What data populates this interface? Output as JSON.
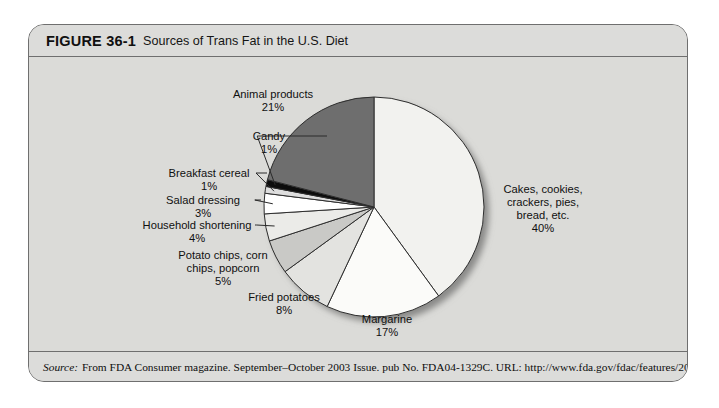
{
  "figure": {
    "number": "FIGURE 36-1",
    "caption": "Sources of Trans Fat in the U.S. Diet"
  },
  "source": {
    "label": "Source:",
    "text": "From FDA Consumer magazine. September–October 2003 Issue. pub No. FDA04-1329C. URL: http://www.fda.gov/fdac/features/2003?504_fats.html"
  },
  "colors": {
    "card_background": "#dcdcda",
    "plot_background": "#dbdbd8",
    "border": "#6f6f6f",
    "slice_stroke": "#2e2e2e",
    "text": "#101010"
  },
  "chart_data": {
    "type": "pie",
    "title": "Sources of Trans Fat in the U.S. Diet",
    "units": "percent",
    "legend": "none",
    "labels_position": "outside-with-leader-lines",
    "start_angle_deg": 0,
    "direction": "clockwise",
    "categories": [
      "Cakes, cookies, crackers, pies, bread, etc.",
      "Margarine",
      "Fried potatoes",
      "Potato chips, corn chips, popcorn",
      "Household shortening",
      "Salad dressing",
      "Breakfast cereal",
      "Candy",
      "Animal products"
    ],
    "values": [
      40,
      17,
      8,
      5,
      4,
      3,
      1,
      1,
      21
    ],
    "slices": [
      {
        "name": "Cakes, cookies, crackers, pies, bread, etc.",
        "label_lines": [
          "Cakes, cookies,",
          "crackers, pies,",
          "bread, etc."
        ],
        "value": 40,
        "value_text": "40%",
        "color": "#f2f2ef",
        "label_x": 542,
        "label_y": 192,
        "anchor": "middle",
        "leader": false
      },
      {
        "name": "Margarine",
        "label_lines": [
          "Margarine"
        ],
        "value": 17,
        "value_text": "17%",
        "color": "#fbfbf9",
        "label_x": 386,
        "label_y": 322,
        "anchor": "middle",
        "leader": false
      },
      {
        "name": "Fried potatoes",
        "label_lines": [
          "Fried potatoes"
        ],
        "value": 8,
        "value_text": "8%",
        "color": "#e3e3e0",
        "label_x": 283,
        "label_y": 300,
        "anchor": "middle",
        "leader": false
      },
      {
        "name": "Potato chips, corn chips, popcorn",
        "label_lines": [
          "Potato chips, corn",
          "chips, popcorn"
        ],
        "value": 5,
        "value_text": "5%",
        "color": "#c9c9c6",
        "label_x": 222,
        "label_y": 258,
        "anchor": "middle",
        "leader": false
      },
      {
        "name": "Household shortening",
        "label_lines": [
          "Household shortening"
        ],
        "value": 4,
        "value_text": "4%",
        "color": "#ebebe8",
        "label_x": 196,
        "label_y": 228,
        "anchor": "middle",
        "leader": true
      },
      {
        "name": "Salad dressing",
        "label_lines": [
          "Salad dressing"
        ],
        "value": 3,
        "value_text": "3%",
        "color": "#ffffff",
        "label_x": 202,
        "label_y": 203,
        "anchor": "middle",
        "leader": true
      },
      {
        "name": "Breakfast cereal",
        "label_lines": [
          "Breakfast cereal"
        ],
        "value": 1,
        "value_text": "1%",
        "color": "#dedede",
        "label_x": 208,
        "label_y": 176,
        "anchor": "middle",
        "leader": true
      },
      {
        "name": "Candy",
        "label_lines": [
          "Candy"
        ],
        "value": 1,
        "value_text": "1%",
        "color": "#0c0c0c",
        "label_x": 268,
        "label_y": 139,
        "anchor": "middle",
        "leader": true
      },
      {
        "name": "Animal products",
        "label_lines": [
          "Animal products"
        ],
        "value": 21,
        "value_text": "21%",
        "color": "#6e6e6e",
        "label_x": 272,
        "label_y": 97,
        "anchor": "middle",
        "leader": false
      }
    ],
    "geometry": {
      "cx": 373,
      "cy": 206,
      "r": 110
    }
  }
}
